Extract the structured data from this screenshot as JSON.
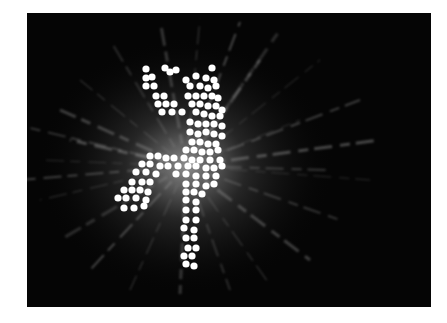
{
  "image": {
    "description": "Photograph of a glowing LED dot-matrix figure of a dancing person with radiating light streaks on a black background",
    "background_color": "#050505",
    "page_color": "#ffffff",
    "dot_color": "#ffffff",
    "streak_color": "#9a9a9a",
    "glow_center": [
      186,
      166
    ],
    "figure_dots": [
      [
        146,
        69
      ],
      [
        165,
        68
      ],
      [
        170,
        72
      ],
      [
        176,
        70
      ],
      [
        212,
        68
      ],
      [
        146,
        78
      ],
      [
        152,
        77
      ],
      [
        186,
        80
      ],
      [
        196,
        76
      ],
      [
        206,
        78
      ],
      [
        214,
        80
      ],
      [
        146,
        86
      ],
      [
        154,
        86
      ],
      [
        190,
        86
      ],
      [
        200,
        86
      ],
      [
        208,
        88
      ],
      [
        216,
        86
      ],
      [
        156,
        96
      ],
      [
        164,
        96
      ],
      [
        188,
        96
      ],
      [
        196,
        96
      ],
      [
        204,
        96
      ],
      [
        212,
        96
      ],
      [
        218,
        98
      ],
      [
        158,
        104
      ],
      [
        166,
        104
      ],
      [
        174,
        104
      ],
      [
        192,
        104
      ],
      [
        200,
        104
      ],
      [
        208,
        106
      ],
      [
        216,
        106
      ],
      [
        222,
        110
      ],
      [
        162,
        112
      ],
      [
        172,
        112
      ],
      [
        182,
        112
      ],
      [
        196,
        112
      ],
      [
        204,
        114
      ],
      [
        212,
        116
      ],
      [
        220,
        116
      ],
      [
        190,
        122
      ],
      [
        198,
        124
      ],
      [
        206,
        124
      ],
      [
        214,
        124
      ],
      [
        222,
        126
      ],
      [
        190,
        132
      ],
      [
        198,
        134
      ],
      [
        206,
        132
      ],
      [
        214,
        134
      ],
      [
        222,
        136
      ],
      [
        192,
        142
      ],
      [
        200,
        142
      ],
      [
        208,
        144
      ],
      [
        216,
        144
      ],
      [
        186,
        150
      ],
      [
        194,
        150
      ],
      [
        202,
        152
      ],
      [
        210,
        152
      ],
      [
        218,
        150
      ],
      [
        150,
        156
      ],
      [
        158,
        156
      ],
      [
        166,
        158
      ],
      [
        174,
        158
      ],
      [
        184,
        158
      ],
      [
        192,
        160
      ],
      [
        200,
        160
      ],
      [
        210,
        160
      ],
      [
        220,
        160
      ],
      [
        142,
        164
      ],
      [
        150,
        164
      ],
      [
        160,
        166
      ],
      [
        168,
        166
      ],
      [
        178,
        166
      ],
      [
        188,
        166
      ],
      [
        196,
        166
      ],
      [
        206,
        168
      ],
      [
        214,
        168
      ],
      [
        222,
        166
      ],
      [
        136,
        172
      ],
      [
        146,
        172
      ],
      [
        156,
        174
      ],
      [
        176,
        174
      ],
      [
        186,
        174
      ],
      [
        196,
        176
      ],
      [
        206,
        176
      ],
      [
        216,
        176
      ],
      [
        132,
        182
      ],
      [
        142,
        182
      ],
      [
        150,
        182
      ],
      [
        186,
        184
      ],
      [
        196,
        184
      ],
      [
        206,
        186
      ],
      [
        214,
        184
      ],
      [
        124,
        190
      ],
      [
        132,
        190
      ],
      [
        140,
        190
      ],
      [
        148,
        192
      ],
      [
        186,
        192
      ],
      [
        194,
        192
      ],
      [
        202,
        194
      ],
      [
        118,
        198
      ],
      [
        126,
        198
      ],
      [
        136,
        198
      ],
      [
        146,
        200
      ],
      [
        186,
        200
      ],
      [
        196,
        202
      ],
      [
        124,
        208
      ],
      [
        134,
        208
      ],
      [
        144,
        206
      ],
      [
        186,
        210
      ],
      [
        196,
        210
      ],
      [
        186,
        220
      ],
      [
        196,
        220
      ],
      [
        184,
        228
      ],
      [
        194,
        230
      ],
      [
        186,
        238
      ],
      [
        194,
        238
      ],
      [
        188,
        248
      ],
      [
        196,
        248
      ],
      [
        184,
        256
      ],
      [
        192,
        256
      ],
      [
        186,
        264
      ],
      [
        194,
        266
      ]
    ],
    "streaks": [
      [
        186,
        166,
        40,
        160
      ],
      [
        186,
        166,
        30,
        128
      ],
      [
        186,
        166,
        60,
        110
      ],
      [
        186,
        166,
        80,
        80
      ],
      [
        186,
        166,
        110,
        40
      ],
      [
        186,
        166,
        160,
        20
      ],
      [
        186,
        166,
        200,
        18
      ],
      [
        186,
        166,
        240,
        22
      ],
      [
        186,
        166,
        280,
        30
      ],
      [
        186,
        166,
        320,
        60
      ],
      [
        186,
        166,
        360,
        100
      ],
      [
        186,
        166,
        380,
        140
      ],
      [
        186,
        166,
        370,
        180
      ],
      [
        186,
        166,
        340,
        220
      ],
      [
        186,
        166,
        310,
        260
      ],
      [
        186,
        166,
        270,
        285
      ],
      [
        186,
        166,
        230,
        290
      ],
      [
        186,
        166,
        180,
        294
      ],
      [
        186,
        166,
        130,
        290
      ],
      [
        186,
        166,
        90,
        270
      ],
      [
        186,
        166,
        60,
        240
      ],
      [
        186,
        166,
        40,
        200
      ],
      [
        186,
        166,
        20,
        180
      ],
      [
        186,
        166,
        70,
        140
      ],
      [
        186,
        166,
        300,
        120
      ],
      [
        186,
        166,
        330,
        170
      ],
      [
        186,
        166,
        260,
        60
      ]
    ]
  }
}
